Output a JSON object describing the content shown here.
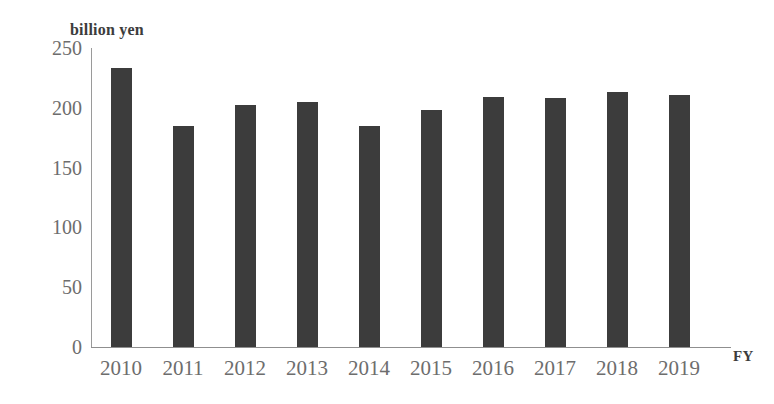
{
  "chart_data": {
    "type": "bar",
    "title": "",
    "subtitle": "",
    "unit_label": "billion yen",
    "xlabel": "FY",
    "ylabel": "",
    "categories": [
      "2010",
      "2011",
      "2012",
      "2013",
      "2014",
      "2015",
      "2016",
      "2017",
      "2018",
      "2019"
    ],
    "values": [
      233,
      185,
      202,
      205,
      185,
      198,
      209,
      208,
      213,
      211
    ],
    "series": [
      {
        "name": "billion yen",
        "values": [
          233,
          185,
          202,
          205,
          185,
          198,
          209,
          208,
          213,
          211
        ]
      }
    ],
    "ylim": [
      0,
      250
    ],
    "y_ticks": [
      0,
      50,
      100,
      150,
      200,
      250
    ],
    "y_tick_labels": [
      "0",
      "50",
      "100",
      "150",
      "200",
      "250"
    ],
    "grid": false,
    "legend": false,
    "legend_position": "none",
    "bar_color": "#3c3c3c",
    "axis_color": "#8f8f8f",
    "tick_label_color": "#6d6d6d",
    "background_color": "#ffffff",
    "annotations": []
  },
  "axes": {
    "y_unit_caption": "billion yen",
    "x_axis_caption": "FY"
  }
}
